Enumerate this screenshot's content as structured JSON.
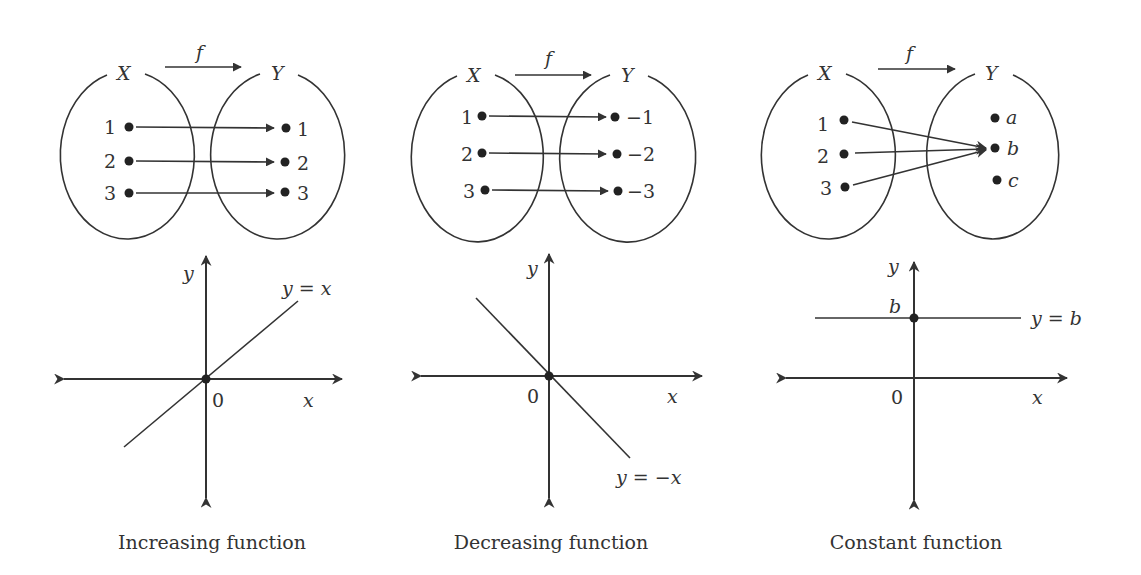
{
  "figure": {
    "panels": [
      {
        "id": "increasing",
        "mapping": {
          "arrow_label": "f",
          "domain_label": "X",
          "codomain_label": "Y",
          "domain_elements": [
            "1",
            "2",
            "3"
          ],
          "codomain_elements": [
            "1",
            "2",
            "3"
          ],
          "mapping_pairs": [
            [
              "1",
              "1"
            ],
            [
              "2",
              "2"
            ],
            [
              "3",
              "3"
            ]
          ]
        },
        "graph": {
          "y_axis_label": "y",
          "x_axis_label": "x",
          "origin_label": "0",
          "line_label": "y = x",
          "caption": "Increasing function"
        }
      },
      {
        "id": "decreasing",
        "mapping": {
          "arrow_label": "f",
          "domain_label": "X",
          "codomain_label": "Y",
          "domain_elements": [
            "1",
            "2",
            "3"
          ],
          "codomain_elements": [
            "−1",
            "−2",
            "−3"
          ],
          "mapping_pairs": [
            [
              "1",
              "-1"
            ],
            [
              "2",
              "-2"
            ],
            [
              "3",
              "-3"
            ]
          ]
        },
        "graph": {
          "y_axis_label": "y",
          "x_axis_label": "x",
          "origin_label": "0",
          "line_label": "y = −x",
          "caption": "Decreasing function"
        }
      },
      {
        "id": "constant",
        "mapping": {
          "arrow_label": "f",
          "domain_label": "X",
          "codomain_label": "Y",
          "domain_elements": [
            "1",
            "2",
            "3"
          ],
          "codomain_elements": [
            "a",
            "b",
            "c"
          ],
          "mapping_pairs": [
            [
              "1",
              "b"
            ],
            [
              "2",
              "b"
            ],
            [
              "3",
              "b"
            ]
          ]
        },
        "graph": {
          "y_axis_label": "y",
          "x_axis_label": "x",
          "origin_label": "0",
          "intercept_label": "b",
          "line_label": "y = b",
          "caption": "Constant function"
        }
      }
    ]
  },
  "colors": {
    "ink": "#333333",
    "background": "#ffffff"
  }
}
